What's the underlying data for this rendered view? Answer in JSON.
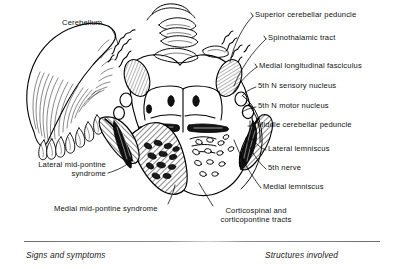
{
  "figure": {
    "background": "#ffffff",
    "ink": "#000000"
  },
  "labels_left": [
    {
      "id": "cerebellum",
      "text": "Cerebellum",
      "x": 62,
      "y": 22,
      "align": "left"
    },
    {
      "id": "lateral-mid-pontine-syndrome",
      "text": "Lateral mid-pontine\nsyndrome",
      "x": 2,
      "y": 163,
      "align": "right",
      "width": 104
    },
    {
      "id": "medial-mid-pontine-syndrome",
      "text": "Medial mid-pontine syndrome",
      "x": 54,
      "y": 207,
      "align": "left"
    }
  ],
  "labels_right": [
    {
      "id": "superior-cerebellar-peduncle",
      "text": "Superior cerebellar peduncle",
      "x": 255,
      "y": 13
    },
    {
      "id": "spinothalamic-tract",
      "text": "Spinothalamic tract",
      "x": 268,
      "y": 36
    },
    {
      "id": "medial-longitudinal-fasciculus",
      "text": "Medial longitudinal fasciculus",
      "x": 259,
      "y": 64
    },
    {
      "id": "5th-n-sensory-nucleus",
      "text": "5th N sensory nucleus",
      "x": 258,
      "y": 84
    },
    {
      "id": "5th-n-motor-nucleus",
      "text": "5th N motor nucleus",
      "x": 258,
      "y": 104
    },
    {
      "id": "middle-cerebellar-peduncle",
      "text": "Middle cerebellar peduncle",
      "x": 257,
      "y": 123
    },
    {
      "id": "lateral-lemniscus",
      "text": "Lateral lemniscus",
      "x": 268,
      "y": 147
    },
    {
      "id": "5th-nerve",
      "text": "5th nerve",
      "x": 268,
      "y": 166
    },
    {
      "id": "medial-lemniscus",
      "text": "Medial lemniscus",
      "x": 263,
      "y": 185
    }
  ],
  "labels_bottom": [
    {
      "id": "corticospinal-corticopontine-tracts",
      "text": "Corticospinal and\ncorticopontine tracts",
      "x": 196,
      "y": 209
    }
  ],
  "captions": {
    "left": "Signs and symptoms",
    "right": "Structures involved"
  }
}
